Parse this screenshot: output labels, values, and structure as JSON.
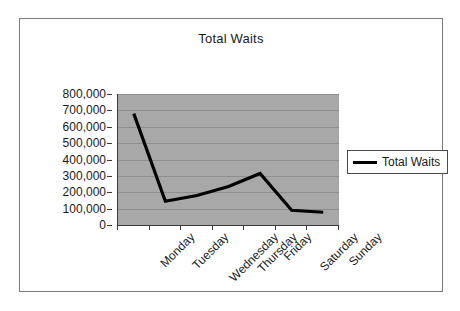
{
  "chart": {
    "title": "Total Waits",
    "legend": {
      "entries": [
        {
          "label": "Total Waits",
          "color": "#000000",
          "swatch": "line-swatch"
        }
      ],
      "position": "right"
    }
  },
  "chart_data": {
    "type": "line",
    "title": "Total Waits",
    "xlabel": "",
    "ylabel": "",
    "categories": [
      "Monday",
      "Tuesday",
      "Wednesday",
      "Thursday",
      "Friday",
      "Saturday",
      "Sunday"
    ],
    "series": [
      {
        "name": "Total Waits",
        "color": "#000000",
        "values": [
          680000,
          145000,
          180000,
          235000,
          315000,
          90000,
          78000
        ]
      }
    ],
    "ylim": [
      0,
      800000
    ],
    "yticks": [
      0,
      100000,
      200000,
      300000,
      400000,
      500000,
      600000,
      700000,
      800000
    ],
    "ytick_labels": [
      "0",
      "100,000",
      "200,000",
      "300,000",
      "400,000",
      "500,000",
      "600,000",
      "700,000",
      "800,000"
    ],
    "grid": "horizontal",
    "plot_background": "#a8a8a8",
    "gridline_color": "#8f8f8f",
    "axis_color": "#3a3a3a",
    "chart_background": "#ffffff",
    "border_color": "#7a7a7a",
    "xtick_label_rotation": -45
  }
}
